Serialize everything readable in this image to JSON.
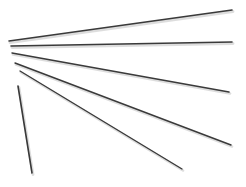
{
  "scene": {
    "description": "Six thin dark sticks fanned out on a white background",
    "background": "#ffffff",
    "stick_color": "#3a3a3a",
    "shadow_color": "#c8c8c8",
    "sticks": [
      {
        "x1": 9,
        "y1": 41,
        "x2": 232,
        "y2": 10,
        "width": 1.6
      },
      {
        "x1": 11,
        "y1": 46,
        "x2": 232,
        "y2": 42,
        "width": 1.6
      },
      {
        "x1": 12,
        "y1": 53,
        "x2": 229,
        "y2": 92,
        "width": 1.5
      },
      {
        "x1": 15,
        "y1": 63,
        "x2": 231,
        "y2": 145,
        "width": 1.4
      },
      {
        "x1": 20,
        "y1": 71,
        "x2": 182,
        "y2": 169,
        "width": 1.4
      },
      {
        "x1": 18,
        "y1": 86,
        "x2": 32,
        "y2": 173,
        "width": 1.6
      }
    ]
  }
}
